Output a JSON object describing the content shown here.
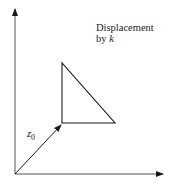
{
  "diagram": {
    "annotation": {
      "line1": "Displacement",
      "line2_prefix": "by ",
      "line2_var": "k"
    },
    "vector_label": {
      "var": "z",
      "subscript": "0"
    },
    "colors": {
      "stroke": "#1a1a1a",
      "background": "#ffffff"
    },
    "geometry": {
      "origin": [
        15,
        174
      ],
      "y_axis_tip": [
        15,
        8
      ],
      "x_axis_tip": [
        164,
        174
      ],
      "vector_tip": [
        62,
        124
      ],
      "triangle": [
        [
          62,
          63
        ],
        [
          62,
          123
        ],
        [
          115,
          123
        ]
      ]
    }
  }
}
